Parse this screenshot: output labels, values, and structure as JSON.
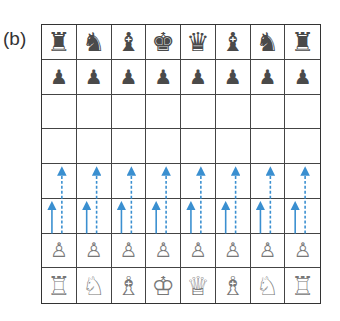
{
  "figure": {
    "label": "(b)",
    "board": {
      "files": 8,
      "ranks": 8,
      "square_size_px": 35,
      "ranks_top_to_bottom": [
        [
          "black-rook",
          "black-knight",
          "black-bishop",
          "black-king",
          "black-queen",
          "black-bishop",
          "black-knight",
          "black-rook"
        ],
        [
          "black-pawn",
          "black-pawn",
          "black-pawn",
          "black-pawn",
          "black-pawn",
          "black-pawn",
          "black-pawn",
          "black-pawn"
        ],
        [
          "",
          "",
          "",
          "",
          "",
          "",
          "",
          ""
        ],
        [
          "",
          "",
          "",
          "",
          "",
          "",
          "",
          ""
        ],
        [
          "",
          "",
          "",
          "",
          "",
          "",
          "",
          ""
        ],
        [
          "",
          "",
          "",
          "",
          "",
          "",
          "",
          ""
        ],
        [
          "white-pawn",
          "white-pawn",
          "white-pawn",
          "white-pawn",
          "white-pawn",
          "white-pawn",
          "white-pawn",
          "white-pawn"
        ],
        [
          "white-rook",
          "white-knight",
          "white-bishop",
          "white-king",
          "white-queen",
          "white-bishop",
          "white-knight",
          "white-rook"
        ]
      ]
    },
    "glyphs": {
      "black-rook": "♜",
      "black-knight": "♞",
      "black-bishop": "♝",
      "black-queen": "♛",
      "black-king": "♚",
      "black-pawn": "♟",
      "white-rook": "♖",
      "white-knight": "♘",
      "white-bishop": "♗",
      "white-queen": "♕",
      "white-king": "♔",
      "white-pawn": "♙"
    },
    "arrows": {
      "color": "#3a8fd0",
      "description": "Each white pawn can advance one square (solid arrow) or two squares (dashed arrow)",
      "one_step_style": "solid",
      "two_step_style": "dashed"
    }
  }
}
